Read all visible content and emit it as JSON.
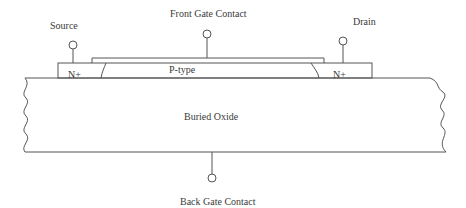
{
  "diagram": {
    "labels": {
      "source": "Source",
      "front_gate": "Front Gate Contact",
      "drain": "Drain",
      "n_plus_left": "N+",
      "p_type": "P-type",
      "n_plus_right": "N+",
      "buried_oxide": "Buried Oxide",
      "back_gate": "Back Gate Contact"
    },
    "colors": {
      "stroke": "#555555",
      "text": "#3a3a3a",
      "background": "#ffffff"
    }
  }
}
